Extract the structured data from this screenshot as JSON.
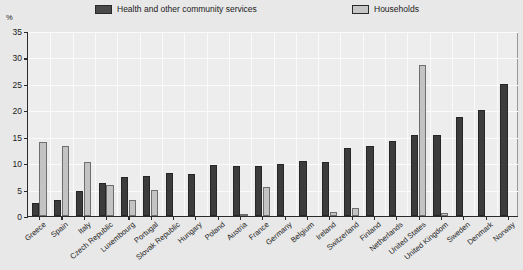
{
  "chart_data": {
    "type": "bar",
    "title": "",
    "subtitle": "",
    "xlabel": "",
    "ylabel": "%",
    "ylim": [
      0,
      35
    ],
    "yticks": [
      0,
      5,
      10,
      15,
      20,
      25,
      30,
      35
    ],
    "grid": true,
    "legend_position": "top",
    "categories": [
      "Greece",
      "Spain",
      "Italy",
      "Czech Republic",
      "Luxembourg",
      "Portugal",
      "Slovak Republic",
      "Hungary",
      "Poland",
      "Austria",
      "France",
      "Germany",
      "Belgium",
      "Ireland",
      "Switzerland",
      "Finland",
      "Netherlands",
      "United States",
      "United Kingdom",
      "Sweden",
      "Denmark",
      "Norway"
    ],
    "series": [
      {
        "name": "Health and other community services",
        "color": "#3c3c3c",
        "values": [
          2.4,
          3.0,
          4.8,
          6.2,
          7.3,
          7.5,
          8.1,
          8.0,
          9.6,
          9.4,
          9.5,
          9.8,
          10.4,
          10.2,
          12.8,
          13.2,
          14.2,
          15.3,
          15.4,
          18.8,
          20.1,
          25.0
        ]
      },
      {
        "name": "Households",
        "color": "#c3c3c3",
        "values": [
          14.0,
          13.2,
          10.3,
          5.8,
          3.0,
          5.0,
          0.0,
          0.0,
          0.0,
          0.3,
          5.4,
          0.0,
          0.0,
          0.8,
          1.6,
          0.0,
          0.0,
          28.6,
          0.5,
          0.0,
          0.0,
          0.0
        ]
      }
    ]
  },
  "legend": {
    "items": [
      {
        "label": "Health and other community services",
        "swatch": "dark-swatch"
      },
      {
        "label": "Households",
        "swatch": "light-swatch"
      }
    ]
  },
  "axis": {
    "unit": "%",
    "y_labels": [
      "35",
      "30",
      "25",
      "20",
      "15",
      "10",
      "5",
      "0"
    ]
  }
}
